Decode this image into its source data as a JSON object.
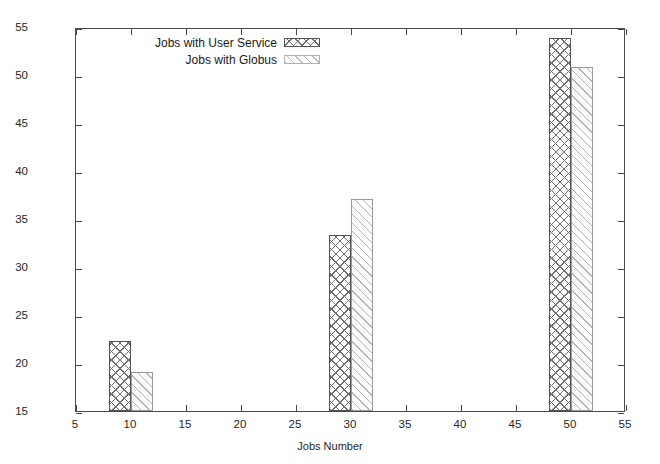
{
  "chart_data": {
    "type": "bar",
    "title": "",
    "xlabel": "Jobs Number",
    "ylabel": "Turn-around Time (Second)",
    "xlim": [
      5,
      55
    ],
    "ylim": [
      15,
      55
    ],
    "xticks": [
      5,
      10,
      15,
      20,
      25,
      30,
      35,
      40,
      45,
      50,
      55
    ],
    "yticks": [
      15,
      20,
      25,
      30,
      35,
      40,
      45,
      50,
      55
    ],
    "grid": false,
    "legend_position": "top-left-inside",
    "categories": [
      10,
      30,
      50
    ],
    "bar_width": 2,
    "series": [
      {
        "name": "Jobs with User Service",
        "pattern": "crosshatch",
        "values": [
          22.3,
          33.3,
          53.9
        ],
        "x_left": [
          8,
          28,
          48
        ]
      },
      {
        "name": "Jobs with Globus",
        "pattern": "diagonal-hatch",
        "values": [
          19.1,
          37.1,
          50.8
        ],
        "x_left": [
          10,
          30,
          50
        ]
      }
    ]
  },
  "legend": {
    "items": [
      {
        "label": "Jobs with User Service",
        "swatch": "crosshatch-swatch"
      },
      {
        "label": "Jobs with Globus",
        "swatch": "diagonal-hatch-swatch"
      }
    ]
  },
  "axes": {
    "x_title": "Jobs Number",
    "y_title": "Turn-around Time (Second)",
    "x_tick_labels": [
      "5",
      "10",
      "15",
      "20",
      "25",
      "30",
      "35",
      "40",
      "45",
      "50",
      "55"
    ],
    "y_tick_labels": [
      "15",
      "20",
      "25",
      "30",
      "35",
      "40",
      "45",
      "50",
      "55"
    ]
  }
}
